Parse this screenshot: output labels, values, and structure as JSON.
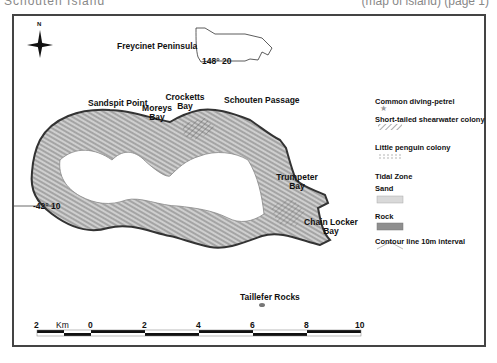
{
  "header_cut": {
    "left_text": "Schouten Island",
    "right_text": "(map of island) (page 1)"
  },
  "map": {
    "north_label": "N",
    "inset": {
      "label": "Freycinet Peninsula",
      "longitude": "148° 20"
    },
    "latitude": "-42° 10",
    "places": [
      {
        "name": "Sandspit Point"
      },
      {
        "name": "Moreys Bay"
      },
      {
        "name": "Crocketts Bay"
      },
      {
        "name": "Schouten Passage"
      },
      {
        "name": "Trumpeter Bay"
      },
      {
        "name": "Chain Locker Bay"
      },
      {
        "name": "Taillefer Rocks"
      }
    ]
  },
  "legend": {
    "items": [
      {
        "label": "Common diving-petrel",
        "symbol": "star-icon"
      },
      {
        "label": "Short-tailed shearwater colony",
        "symbol": "hatch-icon"
      },
      {
        "label": "Little penguin colony",
        "symbol": "dot-grid-icon"
      },
      {
        "label": "Tidal Zone",
        "symbol": ""
      },
      {
        "label": "Sand",
        "symbol": "sand-swatch"
      },
      {
        "label": "Rock",
        "symbol": "rock-swatch"
      },
      {
        "label": "Contour line 10m interval",
        "symbol": "contour-line-icon"
      }
    ]
  },
  "scale_bar": {
    "unit": "Km",
    "ticks": [
      "2",
      "0",
      "2",
      "4",
      "6",
      "8",
      "10"
    ]
  }
}
